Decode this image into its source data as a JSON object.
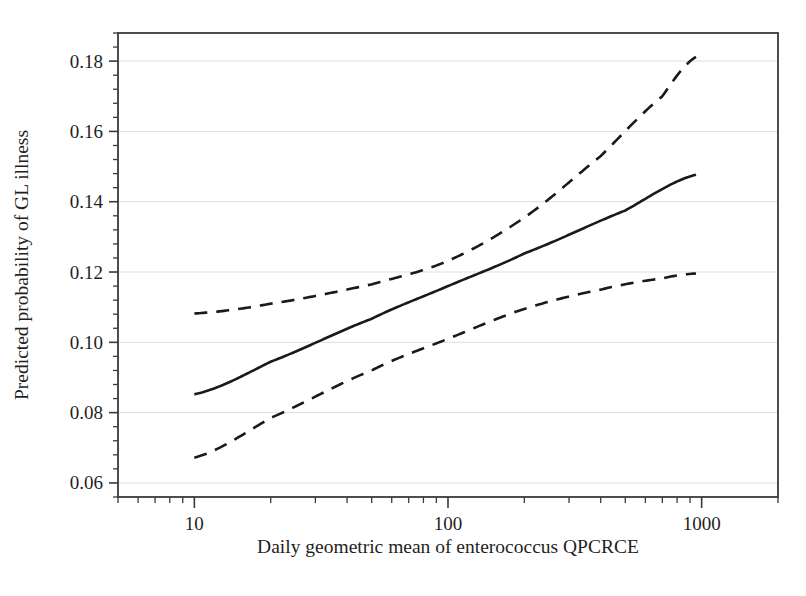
{
  "chart_data": {
    "type": "line",
    "title": "",
    "subtitle": "",
    "xlabel": "Daily geometric mean of enterococcus QPCRCE",
    "ylabel": "Predicted probability of GL illness",
    "xscale": "log",
    "yscale": "linear",
    "xlim": [
      5,
      2000
    ],
    "ylim": [
      0.056,
      0.188
    ],
    "xticks": [
      10,
      100,
      1000
    ],
    "xtick_labels": [
      "10",
      "100",
      "1000"
    ],
    "yticks": [
      0.06,
      0.08,
      0.1,
      0.12,
      0.14,
      0.16,
      0.18
    ],
    "ytick_labels": [
      "0.06",
      "0.08",
      "0.10",
      "0.12",
      "0.14",
      "0.16",
      "0.18"
    ],
    "grid": "horizontal-major-only",
    "minor_ticks": true,
    "legend": "none",
    "x_data_range": [
      10,
      950
    ],
    "series": [
      {
        "name": "Predicted probability",
        "style": "solid",
        "color": "#1a1a1a",
        "width": 2.6,
        "points": [
          {
            "x": 10,
            "y": 0.0852
          },
          {
            "x": 20,
            "y": 0.0945
          },
          {
            "x": 50,
            "y": 0.1067
          },
          {
            "x": 100,
            "y": 0.116
          },
          {
            "x": 200,
            "y": 0.1253
          },
          {
            "x": 500,
            "y": 0.1375
          },
          {
            "x": 950,
            "y": 0.1477
          }
        ]
      },
      {
        "name": "Upper 95% confidence limit",
        "style": "dashed",
        "color": "#1a1a1a",
        "width": 2.6,
        "points": [
          {
            "x": 10,
            "y": 0.1082
          },
          {
            "x": 20,
            "y": 0.111
          },
          {
            "x": 50,
            "y": 0.1165
          },
          {
            "x": 100,
            "y": 0.1232
          },
          {
            "x": 200,
            "y": 0.1355
          },
          {
            "x": 400,
            "y": 0.153
          },
          {
            "x": 700,
            "y": 0.17
          },
          {
            "x": 950,
            "y": 0.1812
          }
        ]
      },
      {
        "name": "Lower 95% confidence limit",
        "style": "dashed",
        "color": "#1a1a1a",
        "width": 2.6,
        "points": [
          {
            "x": 10,
            "y": 0.0672
          },
          {
            "x": 20,
            "y": 0.0785
          },
          {
            "x": 50,
            "y": 0.092
          },
          {
            "x": 100,
            "y": 0.101
          },
          {
            "x": 200,
            "y": 0.1095
          },
          {
            "x": 400,
            "y": 0.115
          },
          {
            "x": 700,
            "y": 0.1182
          },
          {
            "x": 950,
            "y": 0.1196
          }
        ]
      }
    ]
  },
  "figure": {
    "background_color": "#ffffff",
    "frame_color": "#3a3a3a",
    "gridline_color": "#dedede",
    "line_color": "#1a1a1a"
  }
}
